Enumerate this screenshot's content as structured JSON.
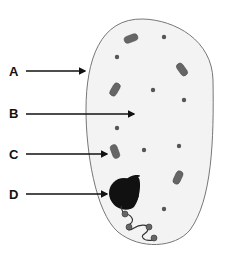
{
  "diagram": {
    "labels": [
      {
        "id": "A",
        "text": "A",
        "target": "cell membrane"
      },
      {
        "id": "B",
        "text": "B",
        "target": "cytoplasm"
      },
      {
        "id": "C",
        "text": "C",
        "target": "mitochondrion"
      },
      {
        "id": "D",
        "text": "D",
        "target": "nucleus"
      }
    ],
    "colors": {
      "cell_fill": "#f3f3f3",
      "cell_outline": "#777777",
      "organelle": "#555555",
      "nucleus": "#111111",
      "arrow": "#111111"
    }
  }
}
